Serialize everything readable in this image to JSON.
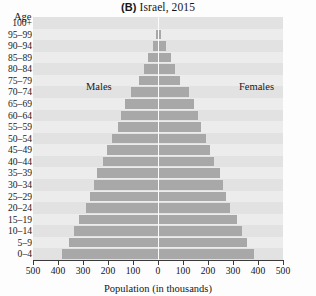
{
  "chart_data": {
    "type": "bar",
    "subtype": "population-pyramid",
    "title": "(B) Israel, 2015",
    "title_prefix": "(B)",
    "title_text": "Israel, 2015",
    "xlabel": "Population (in thousands)",
    "ylabel": "Age",
    "xlim": [
      -500,
      500
    ],
    "xticks": [
      -500,
      -400,
      -300,
      -200,
      -100,
      0,
      100,
      200,
      300,
      400,
      500
    ],
    "xtick_labels": [
      "500",
      "400",
      "300",
      "200",
      "100",
      "0",
      "100",
      "200",
      "300",
      "400",
      "500"
    ],
    "grid": false,
    "legend_position": "inside-plot",
    "categories": [
      "100+",
      "95–99",
      "90–94",
      "85–89",
      "80–84",
      "75–79",
      "70–74",
      "65–69",
      "60–64",
      "55–59",
      "50–54",
      "45–49",
      "40–44",
      "35–39",
      "30–34",
      "25–29",
      "20–24",
      "15–19",
      "10–14",
      "5–9",
      "0–4"
    ],
    "series": [
      {
        "name": "Males",
        "side": "left",
        "color": "#a8a8a8",
        "values": [
          2,
          8,
          22,
          42,
          56,
          76,
          110,
          132,
          150,
          162,
          184,
          204,
          220,
          246,
          258,
          272,
          290,
          318,
          338,
          358,
          384
        ]
      },
      {
        "name": "Females",
        "side": "right",
        "color": "#a8a8a8",
        "values": [
          4,
          12,
          30,
          52,
          68,
          88,
          122,
          142,
          158,
          170,
          190,
          208,
          224,
          248,
          258,
          270,
          288,
          314,
          334,
          356,
          384
        ]
      }
    ]
  },
  "labels": {
    "males": "Males",
    "females": "Females",
    "age_axis": "Age",
    "x_axis": "Population (in thousands)"
  },
  "colors": {
    "bar": "#a8a8a8",
    "plot_background": "#e9e9e9",
    "band_alt": "#e2e2e2",
    "centerline": "#fbfbfb",
    "axis": "#3a3a3a",
    "text": "#1a1a1a"
  }
}
